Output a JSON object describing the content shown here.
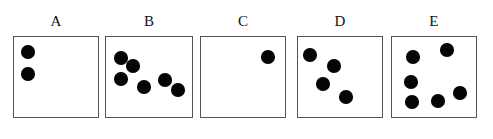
{
  "figure": {
    "title": "",
    "background_color": "#ffffff",
    "dot_color": "#050505",
    "box_border_color": "#555555",
    "label_color": "#111111",
    "panel_count": 5,
    "width": 493,
    "height": 139
  },
  "panels": [
    {
      "label": "A",
      "dot_count": 2,
      "box": {
        "x": 13,
        "y": 36,
        "w": 86,
        "h": 82
      },
      "label_pos": {
        "x": 13,
        "y": 14,
        "w": 86
      },
      "dots": [
        {
          "cx": 28,
          "cy": 52,
          "r": 6.8
        },
        {
          "cx": 28,
          "cy": 74,
          "r": 6.8
        }
      ]
    },
    {
      "label": "B",
      "dot_count": 6,
      "box": {
        "x": 105,
        "y": 36,
        "w": 88,
        "h": 82
      },
      "label_pos": {
        "x": 105,
        "y": 14,
        "w": 88
      },
      "dots": [
        {
          "cx": 121,
          "cy": 58,
          "r": 6.8
        },
        {
          "cx": 133,
          "cy": 66,
          "r": 6.8
        },
        {
          "cx": 121,
          "cy": 79,
          "r": 6.8
        },
        {
          "cx": 144,
          "cy": 87,
          "r": 6.8
        },
        {
          "cx": 165,
          "cy": 80,
          "r": 6.8
        },
        {
          "cx": 178,
          "cy": 90,
          "r": 6.8
        }
      ]
    },
    {
      "label": "C",
      "dot_count": 1,
      "box": {
        "x": 200,
        "y": 36,
        "w": 86,
        "h": 82
      },
      "label_pos": {
        "x": 200,
        "y": 14,
        "w": 86
      },
      "dots": [
        {
          "cx": 268,
          "cy": 57,
          "r": 6.8
        }
      ]
    },
    {
      "label": "D",
      "dot_count": 4,
      "box": {
        "x": 297,
        "y": 36,
        "w": 86,
        "h": 82
      },
      "label_pos": {
        "x": 297,
        "y": 14,
        "w": 86
      },
      "dots": [
        {
          "cx": 310,
          "cy": 55,
          "r": 6.8
        },
        {
          "cx": 334,
          "cy": 66,
          "r": 6.8
        },
        {
          "cx": 323,
          "cy": 84,
          "r": 6.8
        },
        {
          "cx": 346,
          "cy": 97,
          "r": 6.8
        }
      ]
    },
    {
      "label": "E",
      "dot_count": 6,
      "box": {
        "x": 391,
        "y": 36,
        "w": 86,
        "h": 82
      },
      "label_pos": {
        "x": 391,
        "y": 14,
        "w": 86
      },
      "dots": [
        {
          "cx": 447,
          "cy": 50,
          "r": 6.8
        },
        {
          "cx": 413,
          "cy": 57,
          "r": 6.8
        },
        {
          "cx": 411,
          "cy": 82,
          "r": 6.8
        },
        {
          "cx": 412,
          "cy": 102,
          "r": 6.8
        },
        {
          "cx": 438,
          "cy": 101,
          "r": 6.8
        },
        {
          "cx": 460,
          "cy": 93,
          "r": 6.8
        }
      ]
    }
  ]
}
